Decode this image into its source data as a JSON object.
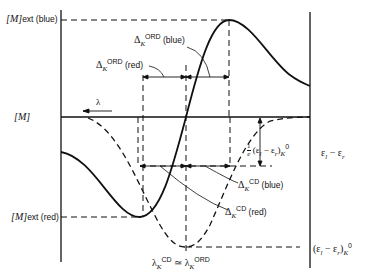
{
  "diagram": {
    "type": "Cotton effect ORD / CD curves",
    "y_labels": {
      "M_ext_blue": {
        "main": "[M]",
        "sub": "ext (blue)"
      },
      "M": "[M]",
      "M_ext_red": {
        "main": "[M]",
        "sub": "ext (red)"
      }
    },
    "lambda_arrow": "λ",
    "annotations": {
      "delta_ord_blue": {
        "sym": "Δ",
        "sub": "K",
        "sup": "ORD",
        "tail": " (blue)"
      },
      "delta_ord_red": {
        "sym": "Δ",
        "sub": "K",
        "sup": "ORD",
        "tail": " (red)"
      },
      "delta_cd_blue": {
        "sym": "Δ",
        "sub": "K",
        "sup": "CD",
        "tail": " (blue)"
      },
      "delta_cd_red": {
        "sym": "Δ",
        "sub": "K",
        "sup": "CD",
        "tail": " (red)"
      },
      "half_height": {
        "frac_num": "1",
        "frac_den": "e",
        "expr": "(ε",
        "l": "l",
        "minus": " − ε",
        "r": "r",
        "close": ")",
        "K": "K",
        "zero": "0"
      },
      "lambda_eq": {
        "left": "λ",
        "left_sub": "K",
        "left_sup": "CD",
        "eq": " ≃ ",
        "right": "λ",
        "right_sub": "K",
        "right_sup": "ORD"
      }
    },
    "right_labels": {
      "eps_diff": "ε",
      "eps_l": "l",
      "eps_minus": " − ε",
      "eps_r": "r",
      "eps_max": {
        "open": "(ε",
        "l": "l",
        "minus": " − ε",
        "r": "r",
        "close": ")",
        "K": "K",
        "zero": "0"
      }
    },
    "curves": [
      {
        "name": "ORD curve",
        "style": "solid"
      },
      {
        "name": "CD curve",
        "style": "dashed"
      }
    ]
  }
}
